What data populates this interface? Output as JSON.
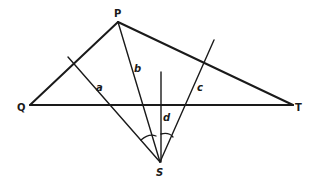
{
  "diagram": {
    "type": "geometry",
    "points": {
      "P": {
        "label": "P",
        "x": 118,
        "y": 22
      },
      "Q": {
        "label": "Q",
        "x": 30,
        "y": 105
      },
      "T": {
        "label": "T",
        "x": 293,
        "y": 105
      },
      "S": {
        "label": "S",
        "x": 160,
        "y": 162
      }
    },
    "lines": {
      "a": {
        "label": "a"
      },
      "b": {
        "label": "b"
      },
      "c": {
        "label": "c"
      },
      "d": {
        "label": "d"
      }
    },
    "color": "#1a1a1a"
  }
}
